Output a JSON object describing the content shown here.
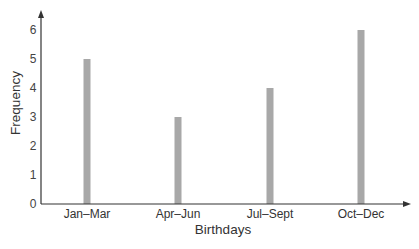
{
  "chart_data": {
    "type": "bar",
    "title": "",
    "xlabel": "Birthdays",
    "ylabel": "Frequency",
    "categories": [
      "Jan–Mar",
      "Apr–Jun",
      "Jul–Sept",
      "Oct–Dec"
    ],
    "values": [
      5,
      3,
      4,
      6
    ],
    "yticks": [
      "0",
      "1",
      "2",
      "3",
      "4",
      "5",
      "6"
    ],
    "ylim": [
      0,
      6.5
    ],
    "grid": false,
    "legend": null,
    "bar_color": "#a8a8a8",
    "axis_color": "#333333"
  }
}
